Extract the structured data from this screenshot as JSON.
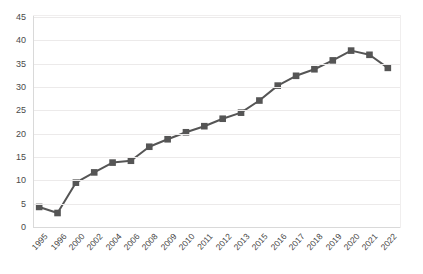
{
  "chart_data": {
    "type": "line",
    "title": "",
    "subtitle": "",
    "xlabel": "",
    "ylabel": "",
    "categories": [
      "1995",
      "1996",
      "2000",
      "2002",
      "2004",
      "2006",
      "2008",
      "2009",
      "2010",
      "2011",
      "2012",
      "2013",
      "2015",
      "2016",
      "2017",
      "2018",
      "2019",
      "2020",
      "2021",
      "2022"
    ],
    "values": [
      4.3,
      3.0,
      9.5,
      11.7,
      13.8,
      14.2,
      17.2,
      18.8,
      20.3,
      21.6,
      23.2,
      24.5,
      27.1,
      30.3,
      32.4,
      33.8,
      35.7,
      37.8,
      36.9,
      34.1
    ],
    "series": [
      {
        "name": "series-1",
        "values": [
          4.3,
          3.0,
          9.5,
          11.7,
          13.8,
          14.2,
          17.2,
          18.8,
          20.3,
          21.6,
          23.2,
          24.5,
          27.1,
          30.3,
          32.4,
          33.8,
          35.7,
          37.8,
          36.9,
          34.1
        ]
      }
    ],
    "ylim": [
      0,
      45
    ],
    "yticks": [
      0,
      5,
      10,
      15,
      20,
      25,
      30,
      35,
      40,
      45
    ],
    "ytick_labels": [
      "0",
      "5",
      "10",
      "15",
      "20",
      "25",
      "30",
      "35",
      "40",
      "45"
    ],
    "grid": true,
    "legend": "none",
    "marker": "square",
    "line_color": "#555555",
    "marker_color": "#555555",
    "grid_color": "#eceaea",
    "axis_color": "#d9d9d9",
    "label_color": "#4a4a4a",
    "background": "#ffffff"
  }
}
